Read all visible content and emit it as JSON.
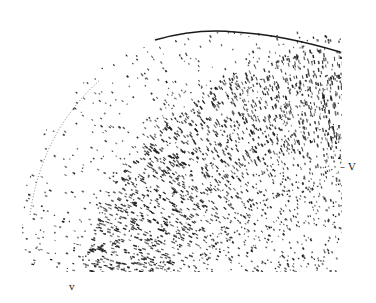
{
  "figure": {
    "ink_color": "#1a1a1a",
    "background_color": "#ffffff"
  },
  "labels": {
    "right": "– V",
    "bottom": "v"
  }
}
